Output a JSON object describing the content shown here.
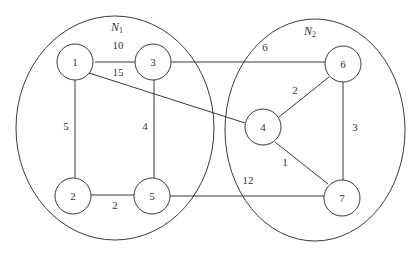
{
  "regions": [
    {
      "id": "N1",
      "label": "N",
      "subscript": "1",
      "cx": 115,
      "cy": 128,
      "rx": 99,
      "ry": 112,
      "label_x": 117,
      "label_y": 27
    },
    {
      "id": "N2",
      "label": "N",
      "subscript": "2",
      "cx": 315,
      "cy": 130,
      "rx": 90,
      "ry": 111,
      "label_x": 310,
      "label_y": 31
    }
  ],
  "nodes": [
    {
      "id": "1",
      "label": "1",
      "x": 75,
      "y": 62,
      "r": 18
    },
    {
      "id": "3",
      "label": "3",
      "x": 153,
      "y": 62,
      "r": 18
    },
    {
      "id": "2",
      "label": "2",
      "x": 73,
      "y": 196,
      "r": 18
    },
    {
      "id": "5",
      "label": "5",
      "x": 152,
      "y": 196,
      "r": 18
    },
    {
      "id": "4",
      "label": "4",
      "x": 263,
      "y": 127,
      "r": 18
    },
    {
      "id": "6",
      "label": "6",
      "x": 343,
      "y": 64,
      "r": 18
    },
    {
      "id": "7",
      "label": "7",
      "x": 342,
      "y": 198,
      "r": 18
    }
  ],
  "edges": [
    {
      "from": "1",
      "to": "3",
      "weight": "10",
      "x1": 95,
      "y1": 62,
      "x2": 135,
      "y2": 62,
      "label_x": 118,
      "label_y": 45
    },
    {
      "from": "1",
      "to": "4",
      "weight": "15",
      "x1": 89,
      "y1": 73,
      "x2": 245,
      "y2": 123,
      "label_x": 118,
      "label_y": 72
    },
    {
      "from": "3",
      "to": "6",
      "weight": "6",
      "x1": 171,
      "y1": 62,
      "x2": 325,
      "y2": 62,
      "label_x": 265,
      "label_y": 47
    },
    {
      "from": "1",
      "to": "2",
      "weight": "5",
      "x1": 75,
      "y1": 80,
      "x2": 75,
      "y2": 178,
      "label_x": 66,
      "label_y": 126
    },
    {
      "from": "3",
      "to": "5",
      "weight": "4",
      "x1": 154,
      "y1": 80,
      "x2": 154,
      "y2": 178,
      "label_x": 145,
      "label_y": 126
    },
    {
      "from": "2",
      "to": "5",
      "weight": "2",
      "x1": 91,
      "y1": 195,
      "x2": 134,
      "y2": 195,
      "label_x": 115,
      "label_y": 205
    },
    {
      "from": "5",
      "to": "7",
      "weight": "12",
      "x1": 170,
      "y1": 196,
      "x2": 324,
      "y2": 196,
      "label_x": 248,
      "label_y": 180
    },
    {
      "from": "4",
      "to": "6",
      "weight": "2",
      "x1": 279,
      "y1": 117,
      "x2": 329,
      "y2": 77,
      "label_x": 295,
      "label_y": 90
    },
    {
      "from": "4",
      "to": "7",
      "weight": "1",
      "x1": 275,
      "y1": 142,
      "x2": 328,
      "y2": 184,
      "label_x": 285,
      "label_y": 162
    },
    {
      "from": "6",
      "to": "7",
      "weight": "3",
      "x1": 343,
      "y1": 82,
      "x2": 343,
      "y2": 180,
      "label_x": 355,
      "label_y": 127
    }
  ]
}
